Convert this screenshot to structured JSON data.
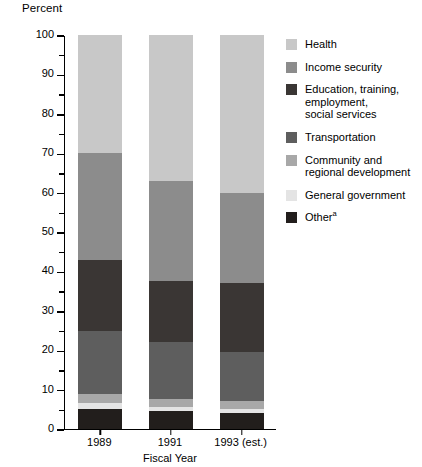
{
  "axis": {
    "y_title": "Percent",
    "x_title": "Fiscal Year",
    "y_ticks_major": [
      "0",
      "10",
      "20",
      "30",
      "40",
      "50",
      "60",
      "70",
      "80",
      "90",
      "100"
    ],
    "y_min": 0,
    "y_max": 100,
    "y_major_step": 10,
    "y_minor_step": 5
  },
  "legend": {
    "items": [
      {
        "label": "Health",
        "color": "#c8c8c8"
      },
      {
        "label": "Income security",
        "color": "#8c8c8c"
      },
      {
        "label": "Education, training,\nemployment,\nsocial services",
        "color": "#3a3634"
      },
      {
        "label": "Transportation",
        "color": "#5e5e5e"
      },
      {
        "label": "Community and\nregional development",
        "color": "#a8a8a8"
      },
      {
        "label": "General government",
        "color": "#e4e4e4"
      },
      {
        "label": "Other",
        "superscript": "a",
        "color": "#221e1c"
      }
    ]
  },
  "chart_data": {
    "type": "bar",
    "stacked": true,
    "title": "",
    "xlabel": "Fiscal Year",
    "ylabel": "Percent",
    "ylim": [
      0,
      100
    ],
    "grid": false,
    "legend_position": "right",
    "categories": [
      "1989",
      "1991",
      "1993 (est.)"
    ],
    "series": [
      {
        "name": "Other",
        "color": "#221e1c",
        "values": [
          5.0,
          4.5,
          4.0
        ]
      },
      {
        "name": "General government",
        "color": "#e4e4e4",
        "values": [
          1.5,
          1.0,
          1.0
        ]
      },
      {
        "name": "Community and regional development",
        "color": "#a8a8a8",
        "values": [
          2.5,
          2.0,
          2.0
        ]
      },
      {
        "name": "Transportation",
        "color": "#5e5e5e",
        "values": [
          16.0,
          14.5,
          12.5
        ]
      },
      {
        "name": "Education, training, employment, social services",
        "color": "#3a3634",
        "values": [
          18.0,
          15.5,
          17.5
        ]
      },
      {
        "name": "Income security",
        "color": "#8c8c8c",
        "values": [
          27.0,
          25.5,
          23.0
        ]
      },
      {
        "name": "Health",
        "color": "#c8c8c8",
        "values": [
          30.0,
          37.0,
          40.0
        ]
      }
    ],
    "stack_order_bottom_to_top": [
      "Other",
      "General government",
      "Community and regional development",
      "Transportation",
      "Education, training, employment, social services",
      "Income security",
      "Health"
    ],
    "cumulative_tops": {
      "1989": [
        5.0,
        6.5,
        9.0,
        25.0,
        43.0,
        70.0,
        100.0
      ],
      "1991": [
        4.5,
        5.5,
        7.5,
        22.0,
        37.5,
        63.0,
        100.0
      ],
      "1993 (est.)": [
        4.0,
        5.0,
        7.0,
        19.5,
        37.0,
        60.0,
        100.0
      ]
    }
  }
}
